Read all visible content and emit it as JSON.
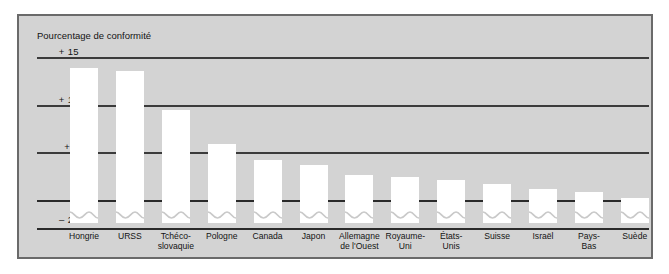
{
  "chart_data": {
    "type": "bar",
    "title": "Pourcentage de conformité",
    "xlabel": "",
    "ylabel": "Pourcentage de conformité",
    "ylim": [
      -25,
      15
    ],
    "yticks": [
      "+ 15",
      "+ 10",
      "+ 5",
      "0",
      "– 25"
    ],
    "ytick_values": [
      15,
      10,
      5,
      0,
      -25
    ],
    "grid": true,
    "legend": "none",
    "axis_break": "Les barres sont coupées entre 0 et – 25",
    "categories": [
      "Hongrie",
      "URSS",
      "Tchéco-\nslovaquie",
      "Pologne",
      "Canada",
      "Japon",
      "Allemagne\nde l'Ouest",
      "Royaume-\nUni",
      "États-\nUnis",
      "Suisse",
      "Israël",
      "Pays-\nBas",
      "Suède"
    ],
    "values": [
      14,
      13.7,
      9.6,
      6,
      4.3,
      3.8,
      2.7,
      2.5,
      2.2,
      1.8,
      1.3,
      0.9,
      0.3
    ],
    "series": [
      {
        "name": "Pourcentage de conformité",
        "values": [
          14,
          13.7,
          9.6,
          6,
          4.3,
          3.8,
          2.7,
          2.5,
          2.2,
          1.8,
          1.3,
          0.9,
          0.3
        ]
      }
    ],
    "colors": {
      "bar": "#ffffff",
      "plot_background": "#d3d3d3",
      "gridline": "#3b3b3b",
      "frame": "#6a6a6a",
      "text": "#141414",
      "page_background": "#ffffff"
    }
  }
}
